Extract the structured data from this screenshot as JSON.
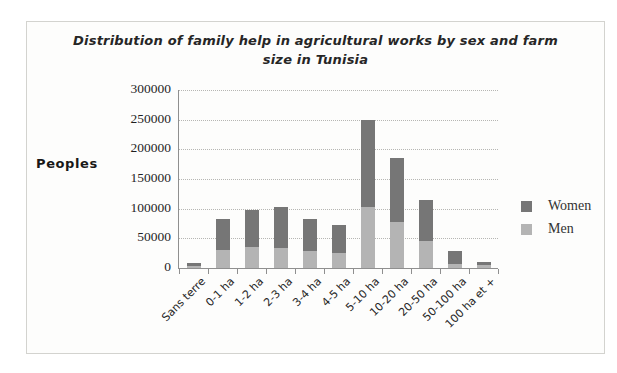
{
  "chart_data": {
    "type": "bar",
    "stacked": true,
    "title": "Distribution of family help in agricultural  works by sex and farm size in Tunisia",
    "title_lines": [
      "Distribution of family help in agricultural  works by sex and farm",
      "size in Tunisia"
    ],
    "ylabel": "Peoples",
    "xlabel": "",
    "categories": [
      "Sans terre",
      "0-1 ha",
      "1-2 ha",
      "2-3 ha",
      "3-4 ha",
      "4-5 ha",
      "5-10 ha",
      "10-20 ha",
      "20-50 ha",
      "50-100 ha",
      "100 ha et +"
    ],
    "series": [
      {
        "name": "Men",
        "color": "#b4b4b4",
        "values": [
          3000,
          30000,
          35000,
          34000,
          29000,
          25000,
          103000,
          77000,
          46000,
          7000,
          5000
        ]
      },
      {
        "name": "Women",
        "color": "#767676",
        "values": [
          6000,
          53000,
          63000,
          68000,
          54000,
          48000,
          147000,
          108000,
          69000,
          21000,
          6000
        ]
      }
    ],
    "y_ticks": [
      0,
      50000,
      100000,
      150000,
      200000,
      250000,
      300000
    ],
    "ylim": [
      0,
      300000
    ],
    "grid": "horizontal-dotted",
    "legend": [
      "Women",
      "Men"
    ],
    "legend_position": "right"
  }
}
